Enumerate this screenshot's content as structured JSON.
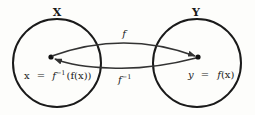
{
  "diagram": {
    "sets": [
      {
        "label": "X",
        "element_label": "x = f⁻¹(f(x))",
        "lhs": "x",
        "eq": "=",
        "rhs_f": "f",
        "rhs_sup": "−1",
        "rhs_arg": "(f(x))"
      },
      {
        "label": "Y",
        "element_label": "y = f(x)",
        "lhs": "y",
        "eq": "=",
        "rhs_f": "f",
        "rhs_arg": "(x)"
      }
    ],
    "arrows": [
      {
        "label": "f",
        "from": "X",
        "to": "Y"
      },
      {
        "label": "f⁻¹",
        "base": "f",
        "sup": "−1",
        "from": "Y",
        "to": "X"
      }
    ],
    "colors": {
      "stroke": "#1a1a1a",
      "arrow": "#333333",
      "background": "#fdfdfb"
    }
  }
}
